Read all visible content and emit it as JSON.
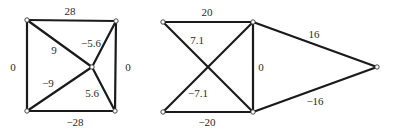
{
  "diagram": {
    "type": "weighted-graph",
    "graphs": [
      {
        "name": "left-graph",
        "nodes": [
          {
            "id": "L_TL",
            "x": 27,
            "y": 20
          },
          {
            "id": "L_TR",
            "x": 116,
            "y": 21
          },
          {
            "id": "L_C",
            "x": 92,
            "y": 67
          },
          {
            "id": "L_BL",
            "x": 27,
            "y": 111
          },
          {
            "id": "L_BR",
            "x": 115,
            "y": 111
          }
        ],
        "edges": [
          {
            "from": "L_TL",
            "to": "L_TR",
            "label": "28",
            "lx": 70,
            "ly": 11
          },
          {
            "from": "L_TL",
            "to": "L_BL",
            "label": "0",
            "lx": 13,
            "ly": 67
          },
          {
            "from": "L_TR",
            "to": "L_BR",
            "label": "0",
            "lx": 128,
            "ly": 67
          },
          {
            "from": "L_BL",
            "to": "L_BR",
            "label": "−28",
            "lx": 75,
            "ly": 122
          },
          {
            "from": "L_TL",
            "to": "L_C",
            "label": "9",
            "lx": 54,
            "ly": 50
          },
          {
            "from": "L_TR",
            "to": "L_C",
            "label": "−5.6",
            "lx": 91,
            "ly": 43
          },
          {
            "from": "L_BL",
            "to": "L_C",
            "label": "−9",
            "lx": 48,
            "ly": 83
          },
          {
            "from": "L_BR",
            "to": "L_C",
            "label": "5.6",
            "lx": 92,
            "ly": 93
          }
        ]
      },
      {
        "name": "right-graph",
        "nodes": [
          {
            "id": "R_TL",
            "x": 163,
            "y": 22
          },
          {
            "id": "R_TR",
            "x": 253,
            "y": 22
          },
          {
            "id": "R_BL",
            "x": 163,
            "y": 112
          },
          {
            "id": "R_BR",
            "x": 253,
            "y": 112
          },
          {
            "id": "R_FAR",
            "x": 377,
            "y": 67
          }
        ],
        "edges": [
          {
            "from": "R_TL",
            "to": "R_TR",
            "label": "20",
            "lx": 207,
            "ly": 12
          },
          {
            "from": "R_BL",
            "to": "R_BR",
            "label": "−20",
            "lx": 207,
            "ly": 122
          },
          {
            "from": "R_TR",
            "to": "R_BR",
            "label": "0",
            "lx": 260,
            "ly": 67
          },
          {
            "from": "R_BL",
            "to": "R_TR",
            "label": "7.1",
            "lx": 197,
            "ly": 40
          },
          {
            "from": "R_TL",
            "to": "R_BR",
            "label": "−7.1",
            "lx": 198,
            "ly": 93
          },
          {
            "from": "R_TR",
            "to": "R_FAR",
            "label": "16",
            "lx": 314,
            "ly": 34
          },
          {
            "from": "R_BR",
            "to": "R_FAR",
            "label": "−16",
            "lx": 315,
            "ly": 101
          }
        ]
      }
    ]
  },
  "labels": {
    "left": {
      "top": "28",
      "left": "0",
      "right": "0",
      "bottom": "−28",
      "diag_tl": "9",
      "diag_tr": "−5.6",
      "diag_bl": "−9",
      "diag_br": "5.6"
    },
    "right": {
      "top": "20",
      "bottom": "−20",
      "vertical": "0",
      "diag_up": "7.1",
      "diag_down": "−7.1",
      "to_far_top": "16",
      "to_far_bottom": "−16"
    }
  }
}
